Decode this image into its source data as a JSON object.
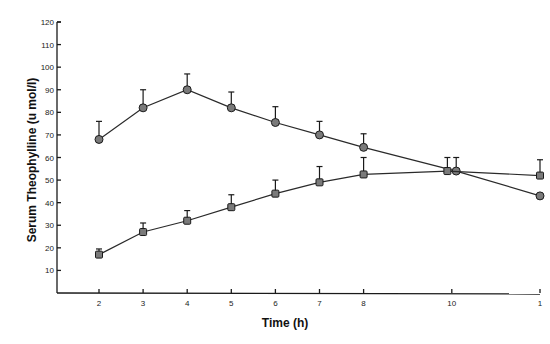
{
  "chart_data": {
    "type": "line",
    "title": "",
    "xlabel": "Time (h)",
    "ylabel": "Serum Theophylline (u mol/l)",
    "xlim": [
      1,
      12
    ],
    "ylim": [
      0,
      120
    ],
    "x_ticks": [
      2,
      3,
      4,
      5,
      6,
      7,
      8,
      10,
      12
    ],
    "x_tick_labels": [
      "2",
      "3",
      "4",
      "5",
      "6",
      "7",
      "8",
      "10",
      "1"
    ],
    "y_ticks": [
      10,
      20,
      30,
      40,
      50,
      60,
      70,
      80,
      90,
      100,
      110,
      120
    ],
    "y_tick_labels": [
      "10",
      "20",
      "30",
      "40",
      "50",
      "60",
      "70",
      "80",
      "90",
      "100",
      "110",
      "120"
    ],
    "grid": false,
    "legend": null,
    "series": [
      {
        "name": "circles",
        "marker": "circle",
        "x": [
          2,
          3,
          4,
          5,
          6,
          7,
          8,
          10.1,
          12
        ],
        "values": [
          68,
          82,
          90,
          82,
          75.5,
          70,
          64.5,
          54,
          43
        ],
        "error_upper": [
          8,
          8,
          7,
          7,
          7,
          6,
          6,
          6,
          0
        ]
      },
      {
        "name": "squares",
        "marker": "square",
        "x": [
          2,
          3,
          4,
          5,
          6,
          7,
          8,
          9.9,
          12
        ],
        "values": [
          17,
          27,
          32,
          38,
          44,
          49,
          52.5,
          54,
          52
        ],
        "error_upper": [
          2.5,
          4,
          4.5,
          5.5,
          6,
          7,
          7.5,
          6,
          7
        ]
      }
    ]
  },
  "colors": {
    "background": "#ffffff",
    "axis": "#1a1a1a",
    "marker_fill": "#7a7a7a",
    "line": "#2a2a2a"
  }
}
